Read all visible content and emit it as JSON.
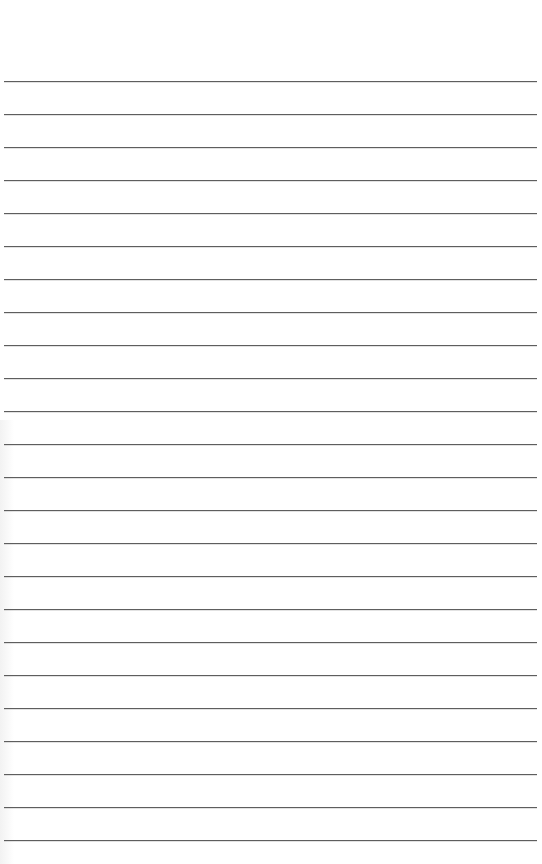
{
  "page": {
    "type": "lined-paper",
    "background_color": "#ffffff",
    "line_color": "#5e5e5e"
  },
  "lines": {
    "count": 24,
    "first_y": 81,
    "spacing": 33,
    "left": 4,
    "width": 533
  }
}
